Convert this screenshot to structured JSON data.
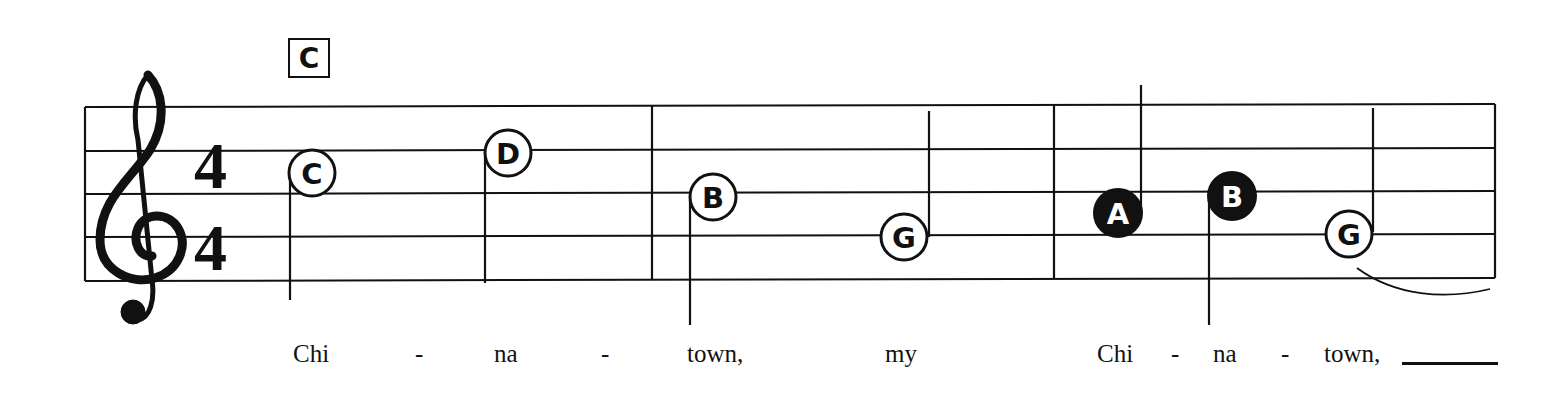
{
  "score": {
    "clef": "treble",
    "time_signature": {
      "top": "4",
      "bottom": "4"
    },
    "chord_symbol": "C",
    "colors": {
      "ink": "#111111",
      "paper": "#ffffff"
    },
    "measures": [
      {
        "notes": [
          {
            "name": "C",
            "duration": "half",
            "style": "hollow"
          },
          {
            "name": "D",
            "duration": "half",
            "style": "hollow"
          }
        ]
      },
      {
        "notes": [
          {
            "name": "B",
            "duration": "half",
            "style": "hollow"
          },
          {
            "name": "G",
            "duration": "half",
            "style": "hollow"
          }
        ]
      },
      {
        "notes": [
          {
            "name": "A",
            "duration": "quarter",
            "style": "filled"
          },
          {
            "name": "B",
            "duration": "quarter",
            "style": "filled"
          },
          {
            "name": "G",
            "duration": "half",
            "style": "hollow",
            "tied": true
          }
        ]
      }
    ]
  },
  "lyrics": [
    {
      "text": "Chi"
    },
    {
      "text": "-"
    },
    {
      "text": "na"
    },
    {
      "text": "-"
    },
    {
      "text": "town,"
    },
    {
      "text": "my"
    },
    {
      "text": "Chi"
    },
    {
      "text": "-"
    },
    {
      "text": "na"
    },
    {
      "text": "-"
    },
    {
      "text": "town,"
    }
  ]
}
